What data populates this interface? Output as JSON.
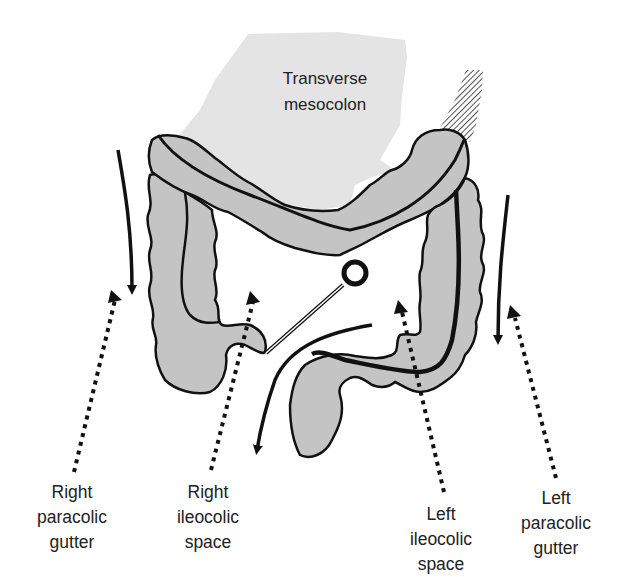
{
  "figure": {
    "colors": {
      "colon_fill": "#c4c4c4",
      "mesocolon_fill": "#e4e4e4",
      "outline": "#111111",
      "background": "#ffffff",
      "text": "#222222"
    }
  },
  "labels": {
    "transverse_mesocolon": {
      "line1": "Transverse",
      "line2": "mesocolon"
    },
    "right_paracolic_gutter": {
      "line1": "Right",
      "line2": "paracolic",
      "line3": "gutter"
    },
    "right_ileocolic_space": {
      "line1": "Right",
      "line2": "ileocolic",
      "line3": "space"
    },
    "left_ileocolic_space": {
      "line1": "Left",
      "line2": "ileocolic",
      "line3": "space"
    },
    "left_paracolic_gutter": {
      "line1": "Left",
      "line2": "paracolic",
      "line3": "gutter"
    }
  },
  "arrows": [
    {
      "name": "right-paracolic-flow",
      "style": "solid",
      "direction": "down"
    },
    {
      "name": "right-paracolic-pointer",
      "style": "dotted",
      "direction": "up"
    },
    {
      "name": "right-ileocolic-pointer",
      "style": "dotted",
      "direction": "up"
    },
    {
      "name": "central-flow",
      "style": "solid",
      "direction": "down-left"
    },
    {
      "name": "left-ileocolic-pointer",
      "style": "dotted",
      "direction": "up"
    },
    {
      "name": "left-paracolic-flow",
      "style": "solid",
      "direction": "down"
    },
    {
      "name": "left-paracolic-pointer",
      "style": "dotted",
      "direction": "up"
    }
  ]
}
